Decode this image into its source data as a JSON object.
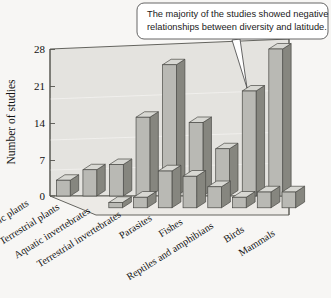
{
  "callout": {
    "line1": "The majority of the studies showed negative",
    "line2": "relationships between diversity and latitude.",
    "border_color": "#555555",
    "fill_color": "#ffffff"
  },
  "chart_data": {
    "type": "bar",
    "title": "",
    "subtitle": "",
    "xlabel": "",
    "ylabel": "Number of studies",
    "ylim": [
      0,
      28
    ],
    "yticks": [
      0,
      7,
      14,
      21,
      28
    ],
    "ytick_labels": [
      "0",
      "7",
      "14",
      "21",
      "28"
    ],
    "grid": false,
    "legend_position": "none",
    "projection": "3d",
    "categories": [
      "Aquatic plants",
      "Terrestrial plants",
      "Aquatic invertebrates",
      "Terrestrial invertebrates",
      "Parasites",
      "Fishes",
      "Reptiles and amphibians",
      "Birds",
      "Mammals"
    ],
    "series": [
      {
        "name": "Negative relationship",
        "values": [
          3,
          5,
          6,
          15,
          25,
          14,
          9,
          20,
          28
        ]
      },
      {
        "name": "No or positive relationship",
        "values": [
          0,
          1,
          2,
          7,
          6,
          4,
          2,
          3,
          3
        ]
      }
    ],
    "bar_colors": {
      "front_face": "#b9b9b4",
      "side_face": "#86867f",
      "top_face": "#d8d8d3",
      "edge": "#4a4a46"
    },
    "panel_colors": {
      "back_wall": "#e3e2de",
      "floor": "#ebeae6",
      "frame": "#55554f"
    }
  },
  "axis": {
    "y_title": "Number of studies"
  }
}
